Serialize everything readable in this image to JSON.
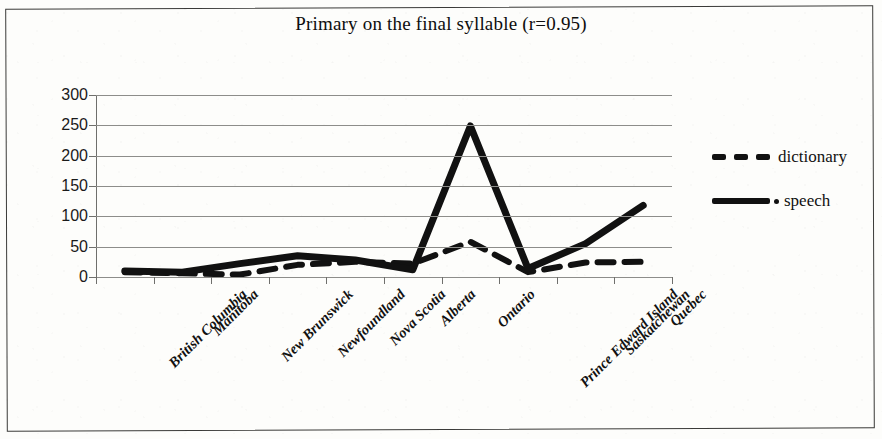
{
  "chart_data": {
    "type": "line",
    "title": "Primary on the final syllable (r=0.95)",
    "xlabel": "",
    "ylabel": "",
    "categories": [
      "British Columbia",
      "Manitoba",
      "New Brunswick",
      "Newfoundland",
      "Nova Scotia",
      "Alberta",
      "Ontario",
      "Prince Edward Island",
      "Saskatchewan",
      "Quebec"
    ],
    "series": [
      {
        "name": "dictionary",
        "style": "dashed",
        "values": [
          8,
          6,
          4,
          20,
          25,
          22,
          58,
          8,
          24,
          25
        ]
      },
      {
        "name": "speech",
        "style": "solid",
        "values": [
          10,
          8,
          22,
          35,
          28,
          12,
          249,
          14,
          55,
          118
        ]
      }
    ],
    "ylim": [
      0,
      300
    ],
    "yticks": [
      0,
      50,
      100,
      150,
      200,
      250,
      300
    ],
    "ytick_labels": [
      "0",
      "50",
      "100",
      "150",
      "200",
      "250",
      "300"
    ],
    "grid": true,
    "legend_position": "right"
  },
  "legend": {
    "entries": [
      {
        "label": "dictionary",
        "marker": "dashed-line"
      },
      {
        "label": "speech",
        "marker": "solid-line-with-dot"
      }
    ]
  },
  "colors": {
    "series": "#111111",
    "gridline": "#8d8d8a",
    "axis": "#6f6f6c",
    "background": "#fdfdfb",
    "border": "#3a3a38"
  }
}
